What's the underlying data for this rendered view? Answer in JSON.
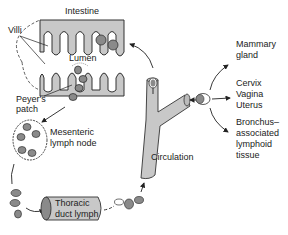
{
  "diagram": {
    "labels": {
      "intestine": "Intestine",
      "villi": "Villi",
      "lumen": "Lumen",
      "peyers_patch": [
        "Peyer's",
        "patch"
      ],
      "mesenteric": [
        "Mesenteric",
        "lymph node"
      ],
      "thoracic": [
        "Thoracic",
        "duct lymph"
      ],
      "circulation": "Circulation",
      "mammary": [
        "Mammary",
        "gland"
      ],
      "cervix": [
        "Cervix",
        "Vagina",
        "Uterus"
      ],
      "bronchus": [
        "Bronchus–",
        "associated",
        "lymphoid",
        "tissue"
      ]
    },
    "colors": {
      "tissue_fill": "#c8c8c8",
      "cell_fill": "#8a8a8a",
      "line": "#222222",
      "background": "#ffffff"
    }
  }
}
